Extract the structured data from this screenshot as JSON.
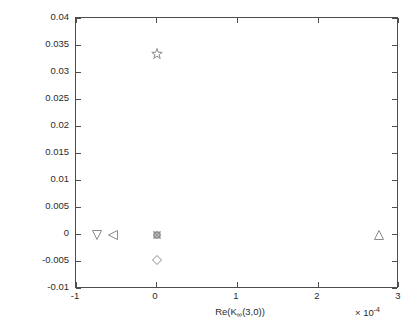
{
  "chart_data": {
    "type": "scatter",
    "title": "",
    "xlabel": "Re(K∞(3,0))",
    "ylabel": "Re(K∞(4,0))",
    "x_exponent_label": "× 10",
    "x_exponent_power": "-4",
    "xlim": [
      -1,
      3
    ],
    "ylim": [
      -0.01,
      0.04
    ],
    "x_ticks": [
      "-1",
      "0",
      "1",
      "2",
      "3"
    ],
    "x_tick_values": [
      -1,
      0,
      1,
      2,
      3
    ],
    "y_ticks": [
      "0.04",
      "0.035",
      "0.03",
      "0.025",
      "0.02",
      "0.015",
      "0.01",
      "0.005",
      "0",
      "-0.005",
      "-0.01"
    ],
    "y_tick_values": [
      0.04,
      0.035,
      0.03,
      0.025,
      0.02,
      0.015,
      0.01,
      0.005,
      0,
      -0.005,
      -0.01
    ],
    "grid": false,
    "legend": "none",
    "marker_color": "#8c8c8c",
    "points": [
      {
        "name": "down-triangle",
        "marker": "triangle-down",
        "x": -0.74,
        "y": 0.0
      },
      {
        "name": "left-triangle",
        "marker": "triangle-left",
        "x": -0.54,
        "y": 0.0
      },
      {
        "name": "star",
        "marker": "pentagram",
        "x": 0.0,
        "y": 0.0333
      },
      {
        "name": "circle-origin",
        "marker": "circle",
        "x": 0.0,
        "y": 0.0
      },
      {
        "name": "square-origin",
        "marker": "square",
        "x": 0.0,
        "y": 0.0
      },
      {
        "name": "cross-origin",
        "marker": "x-cross",
        "x": 0.0,
        "y": 0.0
      },
      {
        "name": "plus-origin",
        "marker": "plus",
        "x": 0.0,
        "y": 0.0
      },
      {
        "name": "diamond",
        "marker": "diamond",
        "x": 0.0,
        "y": -0.0047
      },
      {
        "name": "up-triangle",
        "marker": "triangle-up",
        "x": 2.75,
        "y": 0.0
      }
    ]
  }
}
